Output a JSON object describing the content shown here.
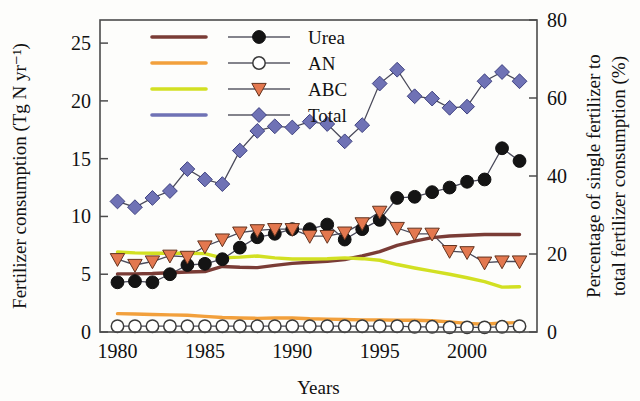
{
  "chart_data": {
    "type": "line",
    "title": "",
    "xlabel": "Years",
    "ylabel": "Fertilizer consumption (Tg N yr⁻¹)",
    "y2label": "Percentage of single fertilizer to total fertilizer consumption (%)",
    "xlim": [
      1979,
      2004
    ],
    "ylim": [
      0,
      27
    ],
    "y2lim": [
      0,
      80
    ],
    "xticks": [
      1980,
      1985,
      1990,
      1995,
      2000
    ],
    "yticks": [
      0,
      5,
      10,
      15,
      20,
      25
    ],
    "y2ticks": [
      0,
      20,
      40,
      60,
      80
    ],
    "grid": false,
    "legend_position": "top-center",
    "x": [
      1980,
      1981,
      1982,
      1983,
      1984,
      1985,
      1986,
      1987,
      1988,
      1989,
      1990,
      1991,
      1992,
      1993,
      1994,
      1995,
      1996,
      1997,
      1998,
      1999,
      2000,
      2001,
      2002,
      2003
    ],
    "series": [
      {
        "name": "Urea",
        "axis": "left",
        "marker": "filled-circle",
        "marker_color": "#141414",
        "line_color": "#5a5a66",
        "values": [
          4.3,
          4.4,
          4.3,
          5.0,
          5.8,
          5.9,
          6.3,
          7.3,
          8.2,
          8.5,
          8.9,
          8.9,
          9.3,
          8.0,
          8.9,
          9.7,
          11.6,
          11.7,
          12.1,
          12.5,
          13.0,
          13.2,
          15.9,
          14.8
        ]
      },
      {
        "name": "AN",
        "axis": "left",
        "marker": "open-circle",
        "marker_color": "#ffffff",
        "line_color": "#5a5a66",
        "values": [
          0.5,
          0.5,
          0.5,
          0.5,
          0.5,
          0.5,
          0.5,
          0.5,
          0.5,
          0.5,
          0.5,
          0.5,
          0.5,
          0.5,
          0.5,
          0.5,
          0.5,
          0.45,
          0.45,
          0.4,
          0.4,
          0.4,
          0.45,
          0.5
        ]
      },
      {
        "name": "ABC",
        "axis": "left",
        "marker": "down-triangle",
        "marker_color": "#e3784f",
        "line_color": "#5a5a66",
        "values": [
          6.3,
          5.8,
          6.1,
          6.6,
          6.5,
          7.4,
          8.0,
          8.6,
          8.8,
          8.9,
          8.9,
          8.3,
          8.3,
          8.6,
          9.4,
          10.4,
          9.0,
          8.5,
          8.5,
          7.0,
          6.9,
          6.0,
          6.1,
          6.1
        ]
      },
      {
        "name": "Total",
        "axis": "left",
        "marker": "diamond",
        "marker_color": "#6f72b5",
        "line_color": "#5a5a66",
        "values": [
          11.3,
          10.8,
          11.6,
          12.2,
          14.1,
          13.2,
          12.8,
          15.7,
          17.4,
          17.8,
          17.7,
          18.2,
          18.0,
          16.5,
          17.9,
          21.5,
          22.7,
          20.4,
          20.2,
          19.4,
          19.5,
          21.7,
          22.5,
          21.7
        ]
      },
      {
        "name": "Urea percentage",
        "axis": "right",
        "marker": "none",
        "line_color": "#7a3c36",
        "values": [
          14.9,
          14.9,
          15.0,
          15.2,
          15.4,
          15.5,
          16.8,
          16.6,
          16.5,
          17.1,
          17.6,
          17.9,
          18.1,
          18.6,
          19.5,
          20.6,
          22.2,
          23.3,
          24.2,
          24.6,
          24.8,
          25.0,
          25.0,
          25.0
        ]
      },
      {
        "name": "AN percentage",
        "axis": "right",
        "marker": "none",
        "line_color": "#f2a03c",
        "values": [
          4.7,
          4.6,
          4.5,
          4.4,
          4.3,
          4.0,
          3.7,
          3.6,
          3.5,
          3.6,
          3.6,
          3.4,
          3.3,
          3.2,
          3.1,
          3.1,
          3.0,
          3.0,
          2.9,
          2.6,
          2.2,
          2.0,
          2.3,
          2.4
        ]
      },
      {
        "name": "ABC percentage",
        "axis": "right",
        "marker": "none",
        "line_color": "#d2e022",
        "values": [
          20.5,
          20.3,
          20.2,
          20.2,
          20.2,
          20.1,
          19.0,
          19.2,
          19.5,
          19.0,
          18.7,
          18.7,
          18.8,
          19.0,
          18.8,
          18.4,
          17.3,
          16.4,
          15.6,
          14.8,
          13.9,
          12.9,
          11.5,
          11.6
        ]
      }
    ],
    "legend": [
      {
        "label": "Urea",
        "line_color": "#7a3c36",
        "marker": "filled-circle",
        "marker_color": "#141414"
      },
      {
        "label": "AN",
        "line_color": "#f2a03c",
        "marker": "open-circle",
        "marker_color": "#ffffff"
      },
      {
        "label": "ABC",
        "line_color": "#d2e022",
        "marker": "down-triangle",
        "marker_color": "#e3784f"
      },
      {
        "label": "Total",
        "line_color": "#6f72b5",
        "marker": "diamond",
        "marker_color": "#6f72b5"
      }
    ]
  }
}
